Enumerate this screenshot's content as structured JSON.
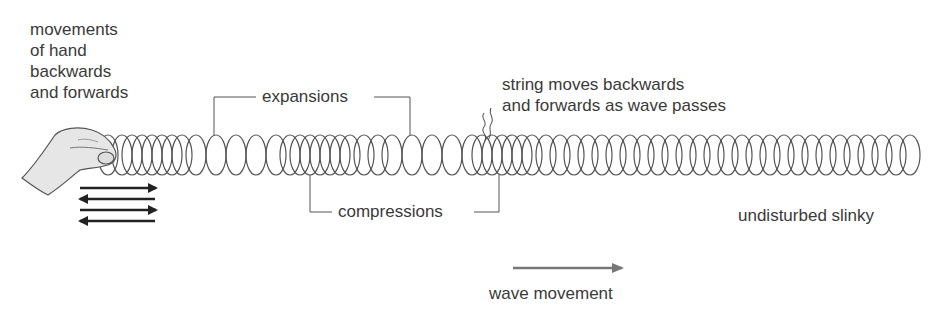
{
  "labels": {
    "hand_movement_line1": "movements",
    "hand_movement_line2": "of hand",
    "hand_movement_line3": "backwards",
    "hand_movement_line4": "and forwards",
    "expansions": "expansions",
    "compressions": "compressions",
    "string_line1": "string moves backwards",
    "string_line2": "and forwards as wave passes",
    "undisturbed": "undisturbed slinky",
    "wave_movement": "wave movement"
  },
  "colors": {
    "ink": "#3a3a3a",
    "coil": "#555555",
    "hand_fill": "#e6e6e6",
    "arrow_gray": "#777777"
  },
  "slinky": {
    "start_x": 100,
    "end_x": 915,
    "center_y": 155,
    "radius_y": 20,
    "compression_centers_x": [
      140,
      310,
      490
    ],
    "expansion_centers_x": [
      215,
      410
    ]
  }
}
